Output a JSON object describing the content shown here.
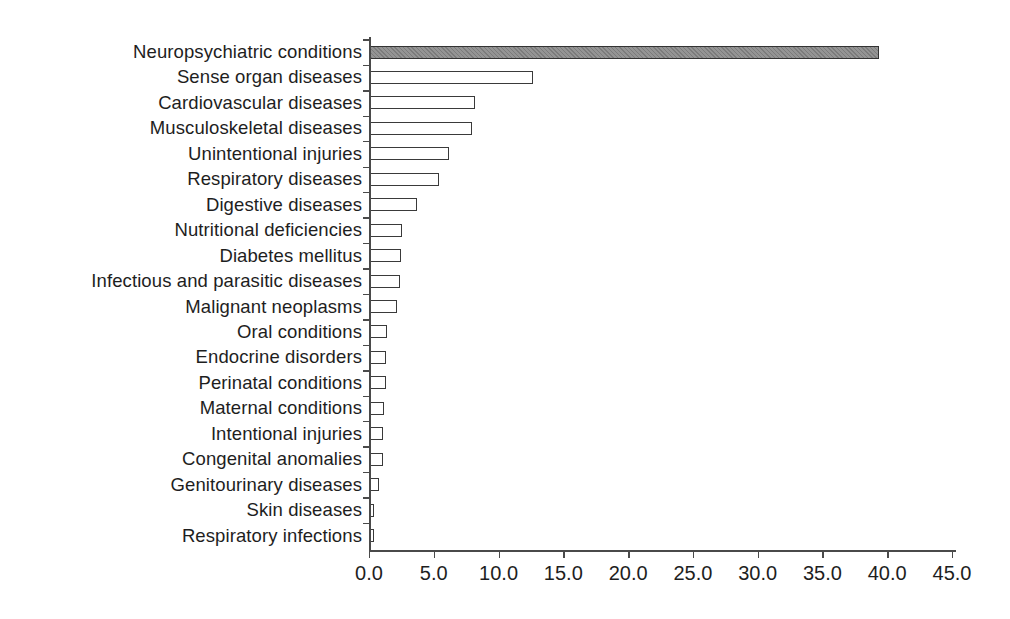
{
  "page": {
    "background": "#ffffff"
  },
  "chart_data": {
    "type": "bar",
    "orientation": "horizontal",
    "title": "",
    "xlabel": "",
    "ylabel": "",
    "categories": [
      "Neuropsychiatric conditions",
      "Sense organ diseases",
      "Cardiovascular diseases",
      "Musculoskeletal diseases",
      "Unintentional injuries",
      "Respiratory diseases",
      "Digestive diseases",
      "Nutritional deficiencies",
      "Diabetes mellitus",
      "Infectious and parasitic diseases",
      "Malignant neoplasms",
      "Oral conditions",
      "Endocrine disorders",
      "Perinatal conditions",
      "Maternal conditions",
      "Intentional injuries",
      "Congenital anomalies",
      "Genitourinary diseases",
      "Skin diseases",
      "Respiratory infections"
    ],
    "values": [
      39.3,
      12.6,
      8.1,
      7.9,
      6.1,
      5.3,
      3.6,
      2.5,
      2.4,
      2.3,
      2.1,
      1.3,
      1.2,
      1.2,
      1.1,
      1.0,
      1.0,
      0.7,
      0.3,
      0.3
    ],
    "xlim": [
      0,
      45
    ],
    "x_ticks": [
      "0.0",
      "5.0",
      "10.0",
      "15.0",
      "20.0",
      "25.0",
      "30.0",
      "35.0",
      "40.0",
      "45.0"
    ],
    "x_tick_values": [
      0,
      5,
      10,
      15,
      20,
      25,
      30,
      35,
      40,
      45
    ],
    "grid": false,
    "legend": false,
    "highlight_index": 0,
    "highlight_fill": "#949494",
    "bar_fill": "#ffffff",
    "bar_border": "#3a3a3a",
    "axis_color": "#4a4a4a",
    "text_color": "#1e1e1e"
  }
}
